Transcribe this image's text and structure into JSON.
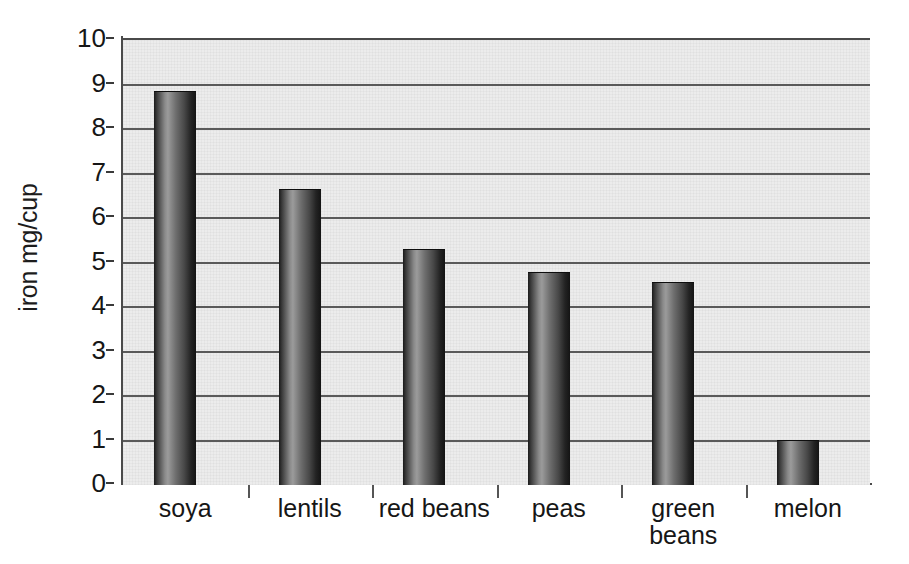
{
  "chart_data": {
    "type": "bar",
    "title": "",
    "subtitle": "",
    "xlabel": "",
    "ylabel": "iron mg/cup",
    "categories": [
      "soya",
      "lentils",
      "red beans",
      "peas",
      "green\nbeans",
      "melon"
    ],
    "values": [
      8.85,
      6.65,
      5.3,
      4.78,
      4.57,
      1.02
    ],
    "ylim": [
      0,
      10
    ],
    "ytick_labels": [
      "0",
      "1",
      "2",
      "3",
      "4",
      "5",
      "6",
      "7",
      "8",
      "9",
      "10"
    ],
    "ytick_values": [
      0,
      1,
      2,
      3,
      4,
      5,
      6,
      7,
      8,
      9,
      10
    ],
    "grid": true,
    "grid_axis": "y",
    "legend": false,
    "legend_position": "none",
    "bar_style": "grayscale-cylinder-gradient",
    "plot_background_color": "#ececec",
    "bar_color_dark": "#1a1a1a",
    "bar_color_light": "#9b9b9b",
    "axis_color": "#4a4a4a",
    "gridline_color": "#5a5a5a",
    "text_color": "#161616"
  }
}
